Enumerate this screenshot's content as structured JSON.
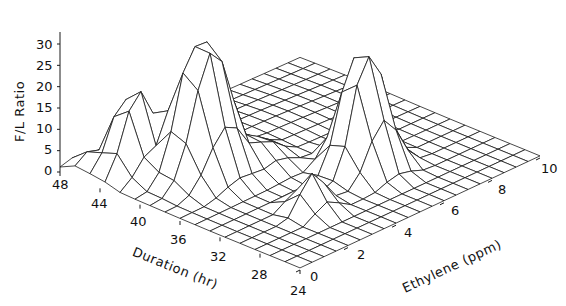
{
  "chart_data": {
    "type": "surface",
    "title": "",
    "xlabel": "Duration (hr)",
    "ylabel": "Ethylene (ppm)",
    "zlabel": "F/L Ratio",
    "x_ticks": [
      48,
      44,
      40,
      36,
      32,
      28,
      24
    ],
    "y_ticks": [
      0,
      2,
      4,
      6,
      8,
      10
    ],
    "z_ticks": [
      0,
      5,
      10,
      15,
      20,
      25,
      30
    ],
    "xlim": [
      24,
      48
    ],
    "ylim": [
      0,
      10
    ],
    "zlim": [
      0,
      30
    ],
    "grid_note": "Wireframe mesh over Duration 24-48 hr (step 2) x Ethylene 0-10 ppm (step 0.5); approximate values read from plot",
    "peaks": [
      {
        "duration_hr": 40,
        "ethylene_ppm": 2.5,
        "f_l_ratio": 30,
        "note": "tallest peak, flat-topped"
      },
      {
        "duration_hr": 32,
        "ethylene_ppm": 6.0,
        "f_l_ratio": 27,
        "note": "second peak, flat-topped"
      },
      {
        "duration_hr": 44,
        "ethylene_ppm": 1.5,
        "f_l_ratio": 21,
        "note": "left peak"
      },
      {
        "duration_hr": 30,
        "ethylene_ppm": 3.0,
        "f_l_ratio": 10,
        "note": "small ridge near front"
      }
    ],
    "baseline": 0.5
  },
  "axes": {
    "z_title": "F/L Ratio",
    "x_title": "Duration (hr)",
    "y_title": "Ethylene (ppm)",
    "z_ticks": [
      "0",
      "5",
      "10",
      "15",
      "20",
      "25",
      "30"
    ],
    "x_ticks": [
      "48",
      "44",
      "40",
      "36",
      "32",
      "28",
      "24"
    ],
    "y_ticks": [
      "0",
      "2",
      "4",
      "6",
      "8",
      "10"
    ]
  }
}
